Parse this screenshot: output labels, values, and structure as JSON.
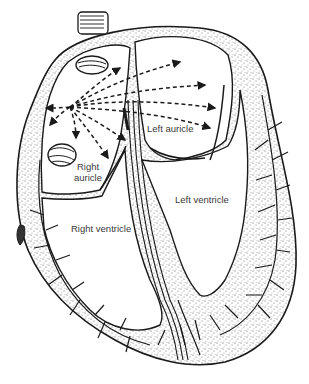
{
  "diagram": {
    "labels": {
      "right_auricle_line1": "Right",
      "right_auricle_line2": "auricle",
      "left_auricle": "Left auricle",
      "right_ventricle": "Right ventricle",
      "left_ventricle": "Left ventricle"
    },
    "colors": {
      "ink": "#1a1a1a",
      "stipple": "#555555",
      "background": "#ffffff",
      "label_text": "#3a3a3a"
    }
  }
}
